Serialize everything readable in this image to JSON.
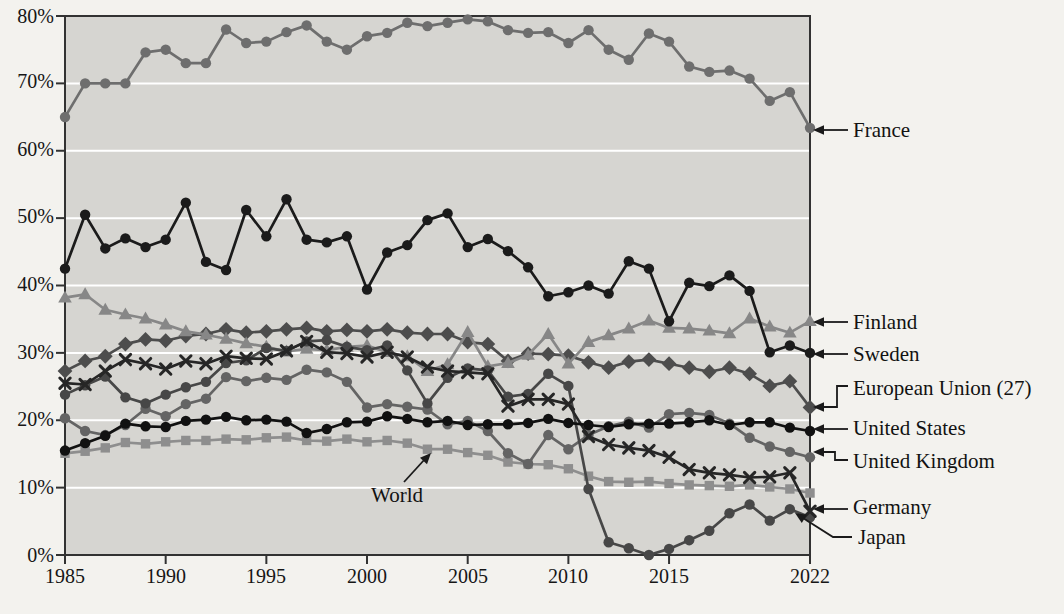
{
  "chart_data": {
    "type": "line",
    "title": "",
    "xlabel": "",
    "ylabel": "",
    "ylim": [
      0,
      80
    ],
    "y_unit": "%",
    "grid": "horizontal white gridlines on gray plot background",
    "legend_position": "right-edge-labels-with-arrows",
    "x": [
      1985,
      1986,
      1987,
      1988,
      1989,
      1990,
      1991,
      1992,
      1993,
      1994,
      1995,
      1996,
      1997,
      1998,
      1999,
      2000,
      2001,
      2002,
      2003,
      2004,
      2005,
      2006,
      2007,
      2008,
      2009,
      2010,
      2011,
      2012,
      2013,
      2014,
      2015,
      2016,
      2017,
      2018,
      2019,
      2020,
      2021,
      2022
    ],
    "x_tick_years": [
      1985,
      1990,
      1995,
      2000,
      2005,
      2010,
      2015,
      2022
    ],
    "x_tick_labels": [
      "1985",
      "1990",
      "1995",
      "2000",
      "2005",
      "2010",
      "2015",
      "2022"
    ],
    "y_tick_labels": [
      "80%",
      "70%",
      "60%",
      "50%",
      "40%",
      "30%",
      "20%",
      "10%",
      "0%"
    ],
    "series": [
      {
        "name": "France",
        "marker": "circle",
        "color": "#6e6e6e",
        "values": [
          65.0,
          70.0,
          70.0,
          70.0,
          74.6,
          75.0,
          73.0,
          73.0,
          78.0,
          76.0,
          76.2,
          77.6,
          78.6,
          76.2,
          75.0,
          77.0,
          77.5,
          79.0,
          78.5,
          79.0,
          79.5,
          79.2,
          77.9,
          77.5,
          77.6,
          76.0,
          77.9,
          75.0,
          73.5,
          77.4,
          76.2,
          72.5,
          71.7,
          71.9,
          70.7,
          67.4,
          68.7,
          63.4
        ]
      },
      {
        "name": "Sweden",
        "marker": "circle",
        "color": "#1b1b1b",
        "values": [
          42.5,
          50.5,
          45.5,
          47.0,
          45.7,
          46.8,
          52.3,
          43.5,
          42.3,
          51.2,
          47.3,
          52.8,
          46.8,
          46.4,
          47.3,
          39.4,
          44.9,
          46.0,
          49.7,
          50.7,
          45.7,
          46.9,
          45.1,
          42.7,
          38.4,
          39.0,
          40.0,
          38.8,
          43.6,
          42.5,
          34.7,
          40.4,
          39.9,
          41.5,
          39.2,
          30.1,
          31.1,
          30.0
        ]
      },
      {
        "name": "Finland",
        "marker": "triangle",
        "color": "#878787",
        "values": [
          38.2,
          38.7,
          36.4,
          35.7,
          35.1,
          34.2,
          33.2,
          32.7,
          32.1,
          31.4,
          30.9,
          30.2,
          30.6,
          30.4,
          30.9,
          31.1,
          30.1,
          29.5,
          27.3,
          28.3,
          33.1,
          28.0,
          28.5,
          29.7,
          32.8,
          28.4,
          31.6,
          32.6,
          33.6,
          34.8,
          33.7,
          33.6,
          33.3,
          32.9,
          35.1,
          33.9,
          33.0,
          34.7
        ]
      },
      {
        "name": "European Union (27)",
        "marker": "diamond",
        "color": "#4d4d4d",
        "values": [
          27.3,
          28.8,
          29.5,
          31.3,
          32.0,
          31.8,
          32.5,
          32.8,
          33.5,
          33.0,
          33.2,
          33.5,
          33.7,
          33.2,
          33.4,
          33.2,
          33.5,
          33.0,
          32.8,
          32.8,
          31.6,
          31.3,
          28.8,
          29.9,
          29.8,
          29.6,
          28.6,
          27.8,
          28.7,
          29.0,
          28.4,
          27.8,
          27.2,
          27.8,
          26.9,
          25.1,
          25.8,
          21.9
        ]
      },
      {
        "name": "United States",
        "marker": "circle",
        "color": "#111111",
        "values": [
          15.5,
          16.6,
          17.7,
          19.5,
          19.1,
          19.0,
          19.9,
          20.1,
          20.5,
          20.0,
          20.1,
          19.8,
          18.1,
          18.7,
          19.7,
          19.8,
          20.6,
          20.2,
          19.7,
          19.9,
          19.3,
          19.4,
          19.4,
          19.6,
          20.2,
          19.6,
          19.3,
          19.0,
          19.4,
          19.5,
          19.5,
          19.7,
          20.0,
          19.3,
          19.7,
          19.7,
          18.9,
          18.4
        ]
      },
      {
        "name": "United Kingdom",
        "marker": "circle",
        "color": "#646464",
        "values": [
          20.3,
          18.4,
          17.8,
          19.3,
          21.7,
          20.6,
          22.4,
          23.2,
          26.4,
          25.8,
          26.3,
          26.0,
          27.5,
          27.1,
          25.7,
          21.9,
          22.4,
          22.0,
          21.6,
          19.4,
          19.9,
          18.4,
          15.1,
          13.5,
          17.8,
          15.7,
          17.8,
          19.1,
          19.8,
          18.9,
          20.9,
          21.1,
          20.8,
          19.5,
          17.4,
          16.1,
          15.3,
          14.5
        ]
      },
      {
        "name": "Germany",
        "marker": "x",
        "color": "#262626",
        "values": [
          25.5,
          25.3,
          27.3,
          29.0,
          28.4,
          27.6,
          28.8,
          28.4,
          29.5,
          29.2,
          29.1,
          30.3,
          31.7,
          30.1,
          29.9,
          29.4,
          30.1,
          29.4,
          27.9,
          27.3,
          27.1,
          26.9,
          22.1,
          23.1,
          23.1,
          22.4,
          17.6,
          16.4,
          15.9,
          15.5,
          14.5,
          12.7,
          12.2,
          11.9,
          11.5,
          11.6,
          12.2,
          6.5
        ]
      },
      {
        "name": "Japan",
        "marker": "circle",
        "color": "#474747",
        "values": [
          23.8,
          25.2,
          26.5,
          23.4,
          22.5,
          23.8,
          24.9,
          25.7,
          28.5,
          28.9,
          30.7,
          30.3,
          31.7,
          31.9,
          30.9,
          30.4,
          31.1,
          27.4,
          22.5,
          26.3,
          27.7,
          27.4,
          23.5,
          23.9,
          26.9,
          25.1,
          9.8,
          1.9,
          1.0,
          0.0,
          0.9,
          2.2,
          3.6,
          6.2,
          7.5,
          5.1,
          6.8,
          5.6
        ]
      },
      {
        "name": "World",
        "marker": "square",
        "color": "#8e8e8e",
        "values": [
          15.1,
          15.4,
          15.9,
          16.7,
          16.5,
          16.8,
          17.0,
          17.0,
          17.2,
          17.1,
          17.4,
          17.5,
          17.0,
          16.9,
          17.2,
          16.8,
          17.0,
          16.6,
          15.7,
          15.7,
          15.2,
          14.8,
          13.8,
          13.5,
          13.4,
          12.8,
          11.7,
          10.9,
          10.8,
          10.9,
          10.6,
          10.4,
          10.3,
          10.2,
          10.4,
          10.1,
          9.8,
          9.2
        ]
      }
    ],
    "right_labels": [
      {
        "text": "France",
        "at_value": 63.4,
        "connector": "arrow"
      },
      {
        "text": "Finland",
        "at_value": 34.7,
        "connector": "arrow"
      },
      {
        "text": "Sweden",
        "at_value": 30.0,
        "connector": "arrow"
      },
      {
        "text": "European Union (27)",
        "at_value": 21.9,
        "connector": "elbow-arrow"
      },
      {
        "text": "United States",
        "at_value": 18.4,
        "connector": "arrow"
      },
      {
        "text": "United Kingdom",
        "at_value": 15.3,
        "connector": "elbow-arrow"
      },
      {
        "text": "Germany",
        "at_value": 6.5,
        "connector": "arrow"
      },
      {
        "text": "Japan",
        "at_value": 5.6,
        "connector": "diagonal-arrow"
      }
    ],
    "annotations": [
      {
        "text": "World",
        "points_to_year": 2003,
        "points_to_value": 15.7
      }
    ],
    "colors": {
      "page_bg": "#f3f2ee",
      "plot_bg": "#d6d5d1",
      "grid": "#ffffff",
      "axis": "#323232",
      "label_text": "#121212"
    }
  }
}
